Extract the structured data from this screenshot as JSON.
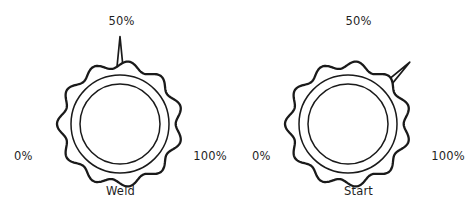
{
  "figure": {
    "type": "control-panel-knob-diagram",
    "background_color": "#ffffff",
    "line_color": "#1a1a1a",
    "text_color": "#1f1f1f"
  },
  "knobs": [
    {
      "id": "weld",
      "name_label": "Weld",
      "scale_min_label": "0%",
      "scale_mid_label": "50%",
      "scale_max_label": "100%",
      "pointer_value": 50,
      "pointer_angle_deg": 0,
      "pointer_direction": "up",
      "lobe_count": 11,
      "center_x": 120,
      "center_y": 124,
      "outer_radius": 63,
      "ring_radius": 49,
      "inner_radius": 40
    },
    {
      "id": "start",
      "name_label": "Start",
      "scale_min_label": "0%",
      "scale_mid_label": "50%",
      "scale_max_label": "100%",
      "pointer_value": 75,
      "pointer_angle_deg": 45,
      "pointer_direction": "up-right",
      "lobe_count": 11,
      "center_x": 110,
      "center_y": 124,
      "outer_radius": 63,
      "ring_radius": 49,
      "inner_radius": 40
    }
  ]
}
